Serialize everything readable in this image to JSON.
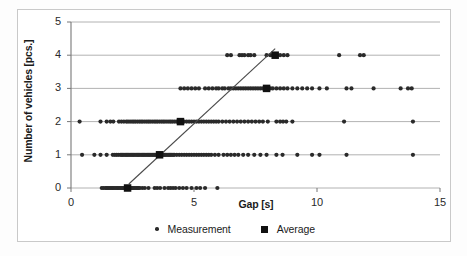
{
  "chart_data": {
    "type": "scatter",
    "title": "",
    "xlabel": "Gap [s]",
    "ylabel": "Number of vehicles [pcs.]",
    "xlim": [
      0,
      15
    ],
    "ylim": [
      0,
      5
    ],
    "xticks": [
      "0",
      "5",
      "10",
      "15"
    ],
    "yticks": [
      "0",
      "1",
      "2",
      "3",
      "4",
      "5"
    ],
    "grid": "horizontal",
    "legend_position": "bottom",
    "series": [
      {
        "name": "Measurement",
        "marker": "dot",
        "color": "#2a2a2a",
        "points_by_row": [
          {
            "y": 0,
            "x": [
              1.25,
              1.32,
              1.4,
              1.45,
              1.5,
              1.55,
              1.6,
              1.66,
              1.7,
              1.75,
              1.8,
              1.86,
              1.9,
              1.95,
              2.0,
              2.05,
              2.1,
              2.15,
              2.2,
              2.25,
              2.3,
              2.35,
              2.4,
              2.45,
              2.5,
              2.55,
              2.6,
              2.65,
              2.7,
              2.75,
              2.8,
              2.9,
              3.0,
              3.15,
              3.4,
              3.5,
              3.62,
              3.8,
              3.95,
              4.05,
              4.15,
              4.25,
              4.4,
              4.55,
              4.7,
              4.9,
              5.1,
              5.25,
              5.45,
              5.95
            ]
          },
          {
            "y": 1,
            "x": [
              0.45,
              0.95,
              1.2,
              1.45,
              1.7,
              1.78,
              1.85,
              1.92,
              2.0,
              2.05,
              2.1,
              2.15,
              2.2,
              2.25,
              2.3,
              2.35,
              2.4,
              2.45,
              2.5,
              2.55,
              2.6,
              2.65,
              2.7,
              2.75,
              2.8,
              2.85,
              2.9,
              2.95,
              3.0,
              3.05,
              3.1,
              3.15,
              3.2,
              3.25,
              3.3,
              3.35,
              3.4,
              3.45,
              3.5,
              3.55,
              3.6,
              3.65,
              3.7,
              3.75,
              3.8,
              3.85,
              3.9,
              3.95,
              4.0,
              4.05,
              4.1,
              4.15,
              4.2,
              4.3,
              4.4,
              4.5,
              4.6,
              4.7,
              4.8,
              4.9,
              5.0,
              5.1,
              5.2,
              5.3,
              5.4,
              5.5,
              5.6,
              5.7,
              5.85,
              6.0,
              6.2,
              6.35,
              6.5,
              6.65,
              6.8,
              7.0,
              7.2,
              7.45,
              7.7,
              7.95,
              8.35,
              8.6,
              9.2,
              9.8,
              10.1,
              11.2,
              13.9
            ]
          },
          {
            "y": 2,
            "x": [
              0.35,
              1.2,
              1.45,
              1.6,
              1.72,
              1.95,
              2.05,
              2.15,
              2.25,
              2.32,
              2.4,
              2.48,
              2.55,
              2.62,
              2.7,
              2.78,
              2.85,
              2.92,
              3.0,
              3.08,
              3.15,
              3.22,
              3.3,
              3.38,
              3.45,
              3.52,
              3.6,
              3.68,
              3.75,
              3.82,
              3.9,
              3.98,
              4.05,
              4.12,
              4.2,
              4.28,
              4.35,
              4.42,
              4.5,
              4.6,
              4.7,
              4.8,
              4.9,
              5.0,
              5.1,
              5.2,
              5.3,
              5.4,
              5.5,
              5.6,
              5.7,
              5.8,
              5.9,
              6.0,
              6.15,
              6.3,
              6.45,
              6.6,
              6.75,
              6.9,
              7.05,
              7.2,
              7.35,
              7.5,
              7.65,
              7.8,
              8.0,
              8.35,
              8.5,
              8.62,
              8.75,
              9.0,
              11.1,
              13.9
            ]
          },
          {
            "y": 3,
            "x": [
              4.45,
              4.6,
              4.75,
              4.9,
              5.05,
              5.2,
              5.45,
              5.6,
              5.75,
              5.9,
              6.0,
              6.15,
              6.25,
              6.4,
              6.5,
              6.6,
              6.7,
              6.8,
              6.9,
              7.0,
              7.1,
              7.2,
              7.3,
              7.4,
              7.5,
              7.6,
              7.7,
              7.8,
              7.9,
              8.0,
              8.1,
              8.2,
              8.35,
              8.5,
              8.65,
              8.8,
              9.0,
              9.2,
              9.4,
              9.6,
              9.8,
              10.1,
              10.4,
              11.2,
              11.4,
              12.3,
              13.4,
              13.7,
              13.85
            ]
          },
          {
            "y": 4,
            "x": [
              6.35,
              6.5,
              6.85,
              6.95,
              7.05,
              7.2,
              7.3,
              7.45,
              7.95,
              8.1,
              8.2,
              8.35,
              8.5,
              8.65,
              8.8,
              10.9,
              11.75,
              11.9
            ]
          }
        ]
      },
      {
        "name": "Average",
        "marker": "square",
        "color": "#111111",
        "points": [
          {
            "x": 2.3,
            "y": 0
          },
          {
            "x": 3.6,
            "y": 1
          },
          {
            "x": 4.45,
            "y": 2
          },
          {
            "x": 7.95,
            "y": 3
          },
          {
            "x": 8.3,
            "y": 4
          }
        ]
      }
    ],
    "trendline": {
      "x0": 2.35,
      "y0": 0.12,
      "x1": 8.3,
      "y1": 4.2,
      "color": "#4a4a4a"
    }
  },
  "legend": {
    "items": [
      {
        "label": "Measurement",
        "marker": "dot"
      },
      {
        "label": "Average",
        "marker": "square"
      }
    ]
  },
  "axes": {
    "x_title": "Gap [s]",
    "y_title": "Number of vehicles [pcs.]",
    "x_tick_labels": [
      "0",
      "5",
      "10",
      "15"
    ],
    "y_tick_labels": [
      "5",
      "4",
      "3",
      "2",
      "1",
      "0"
    ]
  },
  "colors": {
    "point": "#2a2a2a",
    "average": "#111111",
    "grid": "#9e9e9e",
    "axis": "#8a8a8a",
    "frame": "#c9c9c9",
    "text": "#1b1b1b"
  }
}
